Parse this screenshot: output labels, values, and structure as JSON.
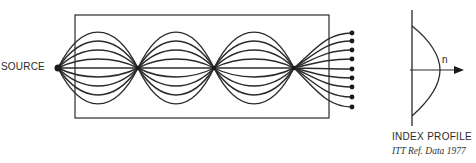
{
  "diagram": {
    "source_label": "SOURCE",
    "profile": {
      "title": "INDEX PROFILE",
      "axis_label": "n"
    },
    "credit": "ITT Ref. Data 1977",
    "colors": {
      "line": "#2b2b2b",
      "background": "#ffffff"
    },
    "geometry": {
      "box": {
        "x": 75,
        "y": 15,
        "w": 254,
        "h": 103
      },
      "axis_y": 68,
      "source_x": 58,
      "focus_points_x": [
        138,
        214,
        294
      ],
      "ray_count": 9,
      "ray_amplitudes": [
        36,
        27,
        18,
        9,
        0,
        -9,
        -18,
        -27,
        -36
      ],
      "output_x": 352,
      "output_y": [
        33,
        41,
        50,
        59,
        69,
        78,
        87,
        97,
        107
      ]
    }
  }
}
